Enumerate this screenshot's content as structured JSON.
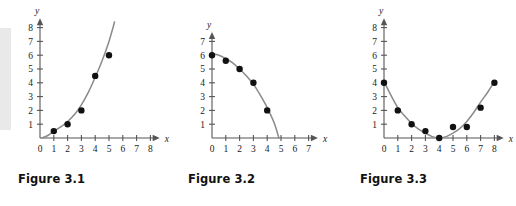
{
  "page": {
    "background_color": "#ffffff",
    "edge_band_color": "#e9e9e9"
  },
  "style": {
    "curve_color": "#8a8a8a",
    "point_color": "#111111",
    "axis_color": "#555555",
    "text_color": "#1a1a1a"
  },
  "figures": [
    {
      "caption": "Figure 3.1",
      "x_axis_label": "x",
      "y_axis_label": "y"
    },
    {
      "caption": "Figure 3.2",
      "x_axis_label": "x",
      "y_axis_label": "y"
    },
    {
      "caption": "Figure 3.3",
      "x_axis_label": "x",
      "y_axis_label": "y"
    }
  ],
  "chart_data": [
    {
      "type": "scatter",
      "title": "Figure 3.1",
      "xlabel": "x",
      "ylabel": "y",
      "xlim": [
        0,
        8.6
      ],
      "ylim": [
        0,
        8.6
      ],
      "xticks": [
        0,
        1,
        2,
        3,
        4,
        5,
        6,
        7,
        8
      ],
      "yticks": [
        1,
        2,
        3,
        4,
        5,
        6,
        7,
        8
      ],
      "xticklabels": [
        "0",
        "1",
        "2",
        "3",
        "4",
        "5",
        "6",
        "7",
        "8"
      ],
      "yticklabels": [
        "1",
        "2",
        "3",
        "4",
        "5",
        "6",
        "7",
        "8"
      ],
      "grid": false,
      "legend": false,
      "series": [
        {
          "name": "data points",
          "kind": "scatter",
          "x": [
            1,
            2,
            3,
            4,
            5
          ],
          "y": [
            0.5,
            1.0,
            2.0,
            4.5,
            6.0
          ]
        },
        {
          "name": "fitted curve",
          "kind": "line",
          "description": "increasing concave-up (quadratic/exponential) trend curve rising from origin past y=8",
          "x": [
            0.15,
            0.6,
            1.0,
            1.5,
            2.0,
            2.5,
            3.0,
            3.5,
            4.0,
            4.5,
            5.0,
            5.4
          ],
          "y": [
            0.0,
            0.2,
            0.5,
            0.8,
            1.2,
            1.7,
            2.4,
            3.3,
            4.4,
            5.6,
            7.0,
            8.4
          ]
        }
      ]
    },
    {
      "type": "scatter",
      "title": "Figure 3.2",
      "xlabel": "x",
      "ylabel": "y",
      "xlim": [
        0,
        7.6
      ],
      "ylim": [
        0,
        7.6
      ],
      "xticks": [
        0,
        1,
        2,
        3,
        4,
        5,
        6,
        7
      ],
      "yticks": [
        1,
        2,
        3,
        4,
        5,
        6,
        7
      ],
      "xticklabels": [
        "0",
        "1",
        "2",
        "3",
        "4",
        "5",
        "6",
        "7"
      ],
      "yticklabels": [
        "1",
        "2",
        "3",
        "4",
        "5",
        "6",
        "7"
      ],
      "grid": false,
      "legend": false,
      "series": [
        {
          "name": "data points",
          "kind": "scatter",
          "x": [
            0,
            1,
            2,
            3,
            4
          ],
          "y": [
            6.0,
            5.6,
            5.0,
            4.0,
            2.0
          ]
        },
        {
          "name": "fitted curve",
          "kind": "line",
          "description": "decreasing concave-down curve starting at (0,6) and crossing the x-axis near x=4.8",
          "x": [
            0.0,
            0.5,
            1.0,
            1.5,
            2.0,
            2.5,
            3.0,
            3.5,
            4.0,
            4.5,
            4.85
          ],
          "y": [
            6.1,
            6.0,
            5.75,
            5.45,
            5.0,
            4.5,
            3.9,
            3.1,
            2.2,
            1.1,
            0.0
          ]
        }
      ]
    },
    {
      "type": "scatter",
      "title": "Figure 3.3",
      "xlabel": "x",
      "ylabel": "y",
      "xlim": [
        0,
        8.6
      ],
      "ylim": [
        0,
        8.6
      ],
      "xticks": [
        0,
        1,
        2,
        3,
        4,
        5,
        6,
        7,
        8
      ],
      "yticks": [
        1,
        2,
        3,
        4,
        5,
        6,
        7,
        8
      ],
      "xticklabels": [
        "0",
        "1",
        "2",
        "3",
        "4",
        "5",
        "6",
        "7",
        "8"
      ],
      "yticklabels": [
        "1",
        "2",
        "3",
        "4",
        "5",
        "6",
        "7",
        "8"
      ],
      "grid": false,
      "legend": false,
      "series": [
        {
          "name": "data points",
          "kind": "scatter",
          "x": [
            0,
            1,
            2,
            3,
            4,
            5,
            6,
            7,
            8
          ],
          "y": [
            4.0,
            2.0,
            1.0,
            0.5,
            0.0,
            0.8,
            0.8,
            2.2,
            4.0
          ]
        },
        {
          "name": "fitted curve",
          "kind": "line",
          "description": "U-shaped parabola with vertex near (4, 0)",
          "x": [
            0.0,
            0.5,
            1.0,
            1.5,
            2.0,
            2.5,
            3.0,
            3.5,
            4.0,
            4.5,
            5.0,
            5.5,
            6.0,
            6.5,
            7.0,
            7.5,
            8.0
          ],
          "y": [
            4.1,
            3.1,
            2.2,
            1.6,
            1.05,
            0.65,
            0.35,
            0.1,
            0.0,
            0.1,
            0.35,
            0.7,
            1.2,
            1.85,
            2.6,
            3.3,
            4.1
          ]
        }
      ]
    }
  ]
}
